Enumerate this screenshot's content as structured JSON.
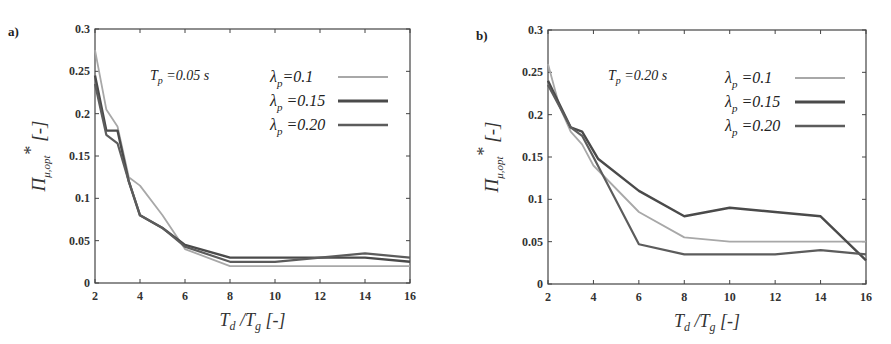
{
  "figure": {
    "panels": [
      "a)",
      "b)"
    ]
  },
  "colors": {
    "lambda_0_1": "#a8a8a8",
    "lambda_0_15": "#4a4a4a",
    "lambda_0_20": "#5c5c5c",
    "axis": "#444444"
  },
  "chart_data": [
    {
      "type": "line",
      "panel_label": "a)",
      "title": "",
      "annotation": "T_p =0.05 s",
      "xlabel": "T_d /T_g [-]",
      "ylabel": "Π_μ,opt* [-]",
      "xlim": [
        2,
        16
      ],
      "ylim": [
        0,
        0.3
      ],
      "xticks": [
        2,
        4,
        6,
        8,
        10,
        12,
        14,
        16
      ],
      "yticks": [
        0,
        0.05,
        0.1,
        0.15,
        0.2,
        0.25,
        0.3
      ],
      "ytick_labels": [
        "0",
        "0.05",
        "0.1",
        "0.15",
        "0.2",
        "0.25",
        "0.3"
      ],
      "grid": false,
      "legend_position": "upper right",
      "series": [
        {
          "name": "λ_p=0.1",
          "x": [
            2,
            2.5,
            3,
            3.5,
            4,
            5,
            6,
            8,
            10,
            12,
            14,
            16
          ],
          "values": [
            0.275,
            0.205,
            0.185,
            0.125,
            0.115,
            0.08,
            0.04,
            0.02,
            0.02,
            0.02,
            0.02,
            0.02
          ]
        },
        {
          "name": "λ_p =0.15",
          "x": [
            2,
            2.5,
            3,
            3.5,
            4,
            5,
            6,
            8,
            10,
            12,
            14,
            16
          ],
          "values": [
            0.245,
            0.18,
            0.18,
            0.12,
            0.08,
            0.065,
            0.045,
            0.03,
            0.03,
            0.03,
            0.03,
            0.025
          ]
        },
        {
          "name": "λ_p =0.20",
          "x": [
            2,
            2.5,
            3,
            3.5,
            4,
            5,
            6,
            8,
            10,
            12,
            14,
            16
          ],
          "values": [
            0.235,
            0.175,
            0.165,
            0.12,
            0.08,
            0.065,
            0.043,
            0.025,
            0.025,
            0.03,
            0.035,
            0.03
          ]
        }
      ]
    },
    {
      "type": "line",
      "panel_label": "b)",
      "title": "",
      "annotation": "T_p =0.20 s",
      "xlabel": "T_d /T_g [-]",
      "ylabel": "Π_μ,opt* [-]",
      "xlim": [
        2,
        16
      ],
      "ylim": [
        0,
        0.3
      ],
      "xticks": [
        2,
        4,
        6,
        8,
        10,
        12,
        14,
        16
      ],
      "yticks": [
        0,
        0.05,
        0.1,
        0.15,
        0.2,
        0.25,
        0.3
      ],
      "ytick_labels": [
        "0",
        "0.05",
        "0.1",
        "0.15",
        "0.2",
        "0.25",
        "0.3"
      ],
      "grid": false,
      "legend_position": "upper right",
      "series": [
        {
          "name": "λ_p =0.1",
          "x": [
            2,
            2.5,
            3,
            3.5,
            4,
            6,
            8,
            10,
            12,
            14,
            16
          ],
          "values": [
            0.26,
            0.21,
            0.18,
            0.165,
            0.14,
            0.085,
            0.055,
            0.05,
            0.05,
            0.05,
            0.05
          ]
        },
        {
          "name": "λ_p =0.15",
          "x": [
            2,
            3,
            3.5,
            4.2,
            6,
            8,
            10,
            12,
            14,
            16
          ],
          "values": [
            0.24,
            0.185,
            0.18,
            0.148,
            0.11,
            0.08,
            0.09,
            0.085,
            0.08,
            0.028
          ]
        },
        {
          "name": "λ_p =0.20",
          "x": [
            2,
            3,
            3.5,
            4,
            6,
            8,
            10,
            12,
            14,
            16
          ],
          "values": [
            0.235,
            0.185,
            0.175,
            0.15,
            0.047,
            0.035,
            0.035,
            0.035,
            0.04,
            0.035
          ]
        }
      ]
    }
  ]
}
